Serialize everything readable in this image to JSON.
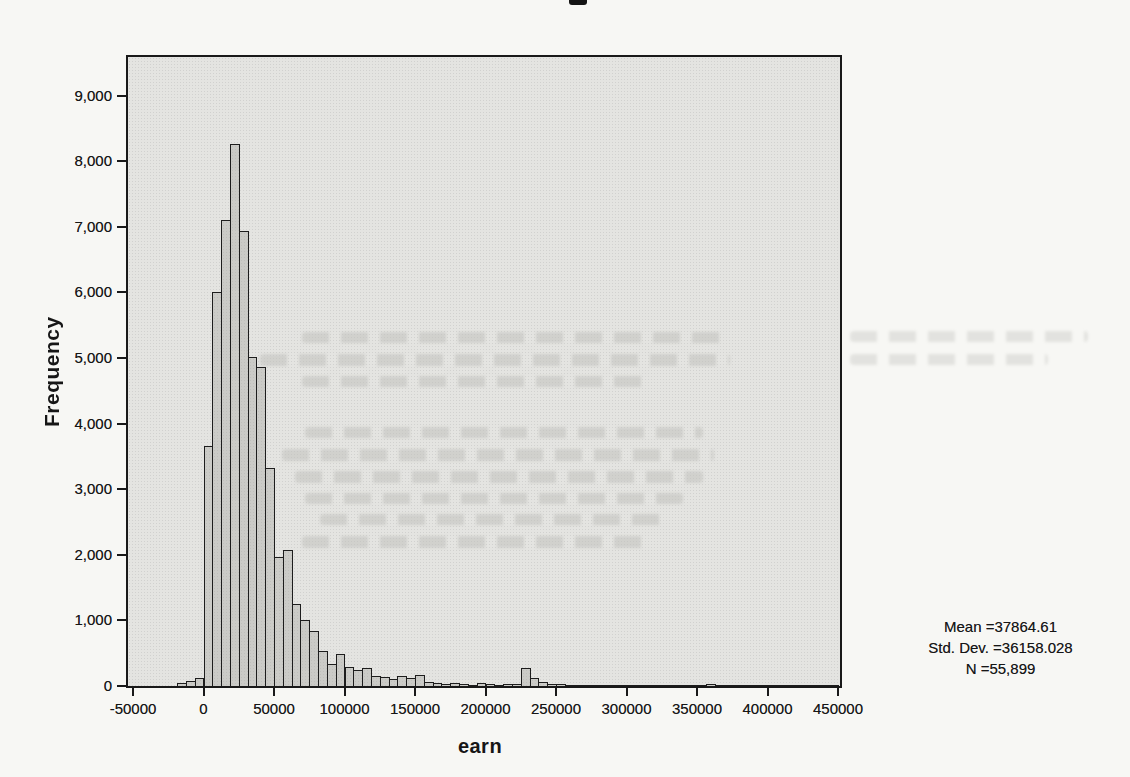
{
  "chart_data": {
    "type": "bar",
    "variable": "earn",
    "title": "",
    "xlabel": "earn",
    "ylabel": "Frequency",
    "x_tick_labels": [
      "-50000",
      "0",
      "50000",
      "100000",
      "150000",
      "200000",
      "250000",
      "300000",
      "350000",
      "400000",
      "450000"
    ],
    "y_tick_labels": [
      "0",
      "1,000",
      "2,000",
      "3,000",
      "4,000",
      "5,000",
      "6,000",
      "7,000",
      "8,000",
      "9,000"
    ],
    "xlim": [
      -55000,
      455000
    ],
    "ylim": [
      0,
      9590
    ],
    "grid": false,
    "legend": "none",
    "bin_width": 6250,
    "first_bin_start": -18750,
    "frequencies": [
      45,
      75,
      125,
      3660,
      6010,
      7100,
      8270,
      6930,
      5020,
      4870,
      3330,
      1960,
      2080,
      1250,
      1000,
      840,
      530,
      330,
      490,
      290,
      240,
      270,
      160,
      140,
      110,
      150,
      120,
      170,
      60,
      40,
      30,
      40,
      25,
      20,
      45,
      25,
      20,
      25,
      30,
      270,
      120,
      60,
      25,
      30,
      15,
      12,
      15,
      12,
      10,
      15,
      12,
      20,
      10,
      12,
      10,
      15,
      12,
      10,
      12,
      15,
      25,
      12,
      10,
      10,
      8,
      10,
      8,
      10,
      8,
      8,
      10,
      8,
      8,
      10,
      8
    ]
  },
  "annotations": {
    "mean": "Mean =37864.61",
    "std_dev": "Std. Dev. =36158.028",
    "n": "N =55,899"
  },
  "colors": {
    "bar_fill": "#cbcbc7",
    "bar_border": "#1d1d1d",
    "plot_background": "#e4e4e1",
    "page_background": "#f7f7f4",
    "axis": "#191919",
    "text": "#161616"
  }
}
